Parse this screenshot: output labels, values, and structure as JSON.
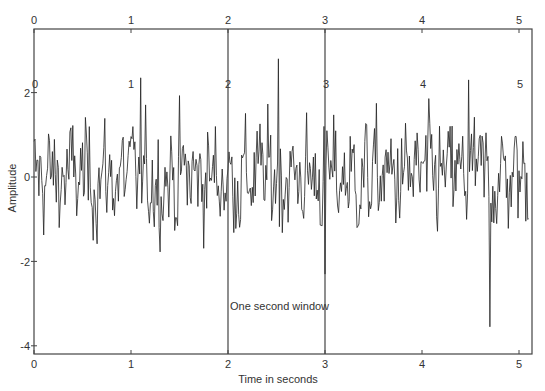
{
  "chart_data": {
    "type": "line",
    "title": "",
    "xlabel": "Time in seconds",
    "ylabel": "Amplitude",
    "xlim": [
      0,
      5.1
    ],
    "ylim": [
      -4.2,
      3.5
    ],
    "x_ticks": [
      0,
      1,
      2,
      3,
      4,
      5
    ],
    "y_ticks": [
      -4,
      -2,
      0,
      2
    ],
    "top_x_ticks": [
      0,
      1,
      2,
      3,
      4,
      5
    ],
    "inner_labels": [
      "0",
      "1",
      "2",
      "3",
      "4",
      "5"
    ],
    "window_lines_x": [
      2,
      3
    ],
    "annotation": "One second window",
    "grid": false,
    "legend": null,
    "series": [
      {
        "name": "random signal",
        "description": "noisy random waveform, roughly zero mean, amplitude mostly between -2 and +2.5; notable spikes near t=2.5 (+2.8) and a deep negative spike near t=4.7 (-3.5)",
        "sample_rate_hint": 100,
        "peaks": [
          {
            "x": 2.52,
            "y": 2.8
          },
          {
            "x": 4.7,
            "y": -3.55
          },
          {
            "x": 3.0,
            "y": -2.3
          },
          {
            "x": 1.1,
            "y": 2.35
          },
          {
            "x": 4.48,
            "y": 2.3
          }
        ]
      }
    ]
  },
  "labels": {
    "ylabel": "Amplitude",
    "xlabel": "Time in seconds",
    "annotation": "One second window",
    "bottom_ticks": [
      "0",
      "1",
      "2",
      "3",
      "4",
      "5"
    ],
    "top_ticks": [
      "0",
      "1",
      "2",
      "3",
      "4",
      "5"
    ],
    "y_ticks": [
      "-4",
      "-2",
      "0",
      "2"
    ],
    "inner": [
      "0",
      "1",
      "2",
      "3",
      "4",
      "5"
    ]
  }
}
